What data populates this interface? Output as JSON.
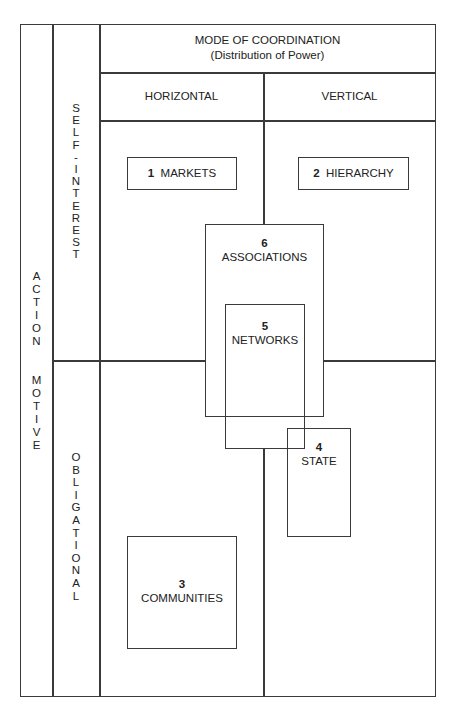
{
  "header": {
    "title": "MODE OF COORDINATION",
    "subtitle": "(Distribution of Power)",
    "columns": [
      "HORIZONTAL",
      "VERTICAL"
    ]
  },
  "rows_axis": {
    "label": "ACTION MOTIVE",
    "word1": "ACTION",
    "word2": "MOTIVE",
    "rows": [
      "SELF-INTEREST",
      "OBLIGATIONAL"
    ]
  },
  "boxes": [
    {
      "num": "1",
      "label": "MARKETS"
    },
    {
      "num": "2",
      "label": "HIERARCHY"
    },
    {
      "num": "3",
      "label": "COMMUNITIES"
    },
    {
      "num": "4",
      "label": "STATE"
    },
    {
      "num": "5",
      "label": "NETWORKS"
    },
    {
      "num": "6",
      "label": "ASSOCIATIONS"
    }
  ],
  "colors": {
    "line": "#3a3a3a",
    "background": "#ffffff",
    "text": "#222222"
  }
}
